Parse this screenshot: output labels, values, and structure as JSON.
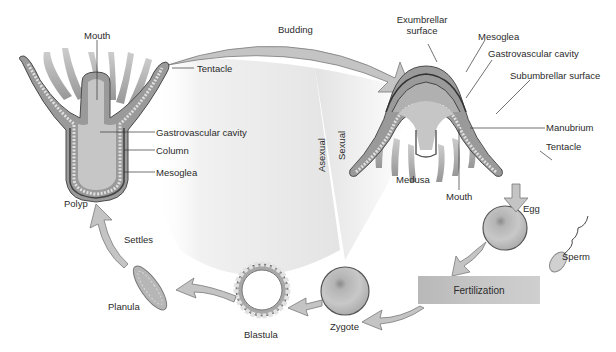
{
  "colors": {
    "background": "#ffffff",
    "shading": "#e4e4e4",
    "tissue": "#9a9a9a",
    "tissue_dark": "#555555",
    "cavity": "#c8c8c8",
    "arrow_fill": "#c4c4c4",
    "arrow_stroke": "#7a7a7a",
    "text": "#2b2b2b"
  },
  "regions": {
    "asexual": "Asexual",
    "sexual": "Sexual"
  },
  "polyp": {
    "name": "Polyp",
    "labels": {
      "mouth": "Mouth",
      "tentacle": "Tentacle",
      "gastrovascular_cavity": "Gastrovascular cavity",
      "column": "Column",
      "mesoglea": "Mesoglea"
    }
  },
  "medusa": {
    "name": "Medusa",
    "labels": {
      "exumbrellar_surface_line1": "Exumbrellar",
      "exumbrellar_surface_line2": "surface",
      "mesoglea": "Mesoglea",
      "gastrovascular_cavity": "Gastrovascular cavity",
      "subumbrellar_surface": "Subumbrellar surface",
      "manubrium": "Manubrium",
      "tentacle": "Tentacle",
      "mouth": "Mouth"
    }
  },
  "stages": {
    "egg": "Egg",
    "sperm": "Sperm",
    "fertilization": "Fertilization",
    "zygote": "Zygote",
    "blastula": "Blastula",
    "planula": "Planula"
  },
  "transitions": {
    "budding": "Budding",
    "settles": "Settles"
  }
}
